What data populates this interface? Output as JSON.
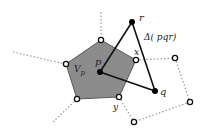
{
  "diagram": {
    "labels": {
      "r": "r",
      "q": "q",
      "p": "p",
      "x": "x",
      "y": "y",
      "cell": "V",
      "cell_sub": "p",
      "triangle": "Δ( pqr)"
    },
    "colors": {
      "cell_fill": "#8c8c8c",
      "cell_stroke": "#555555",
      "edge": "#111111",
      "dotted": "#999999",
      "point_filled": "#000000",
      "point_open_fill": "#ffffff"
    }
  }
}
